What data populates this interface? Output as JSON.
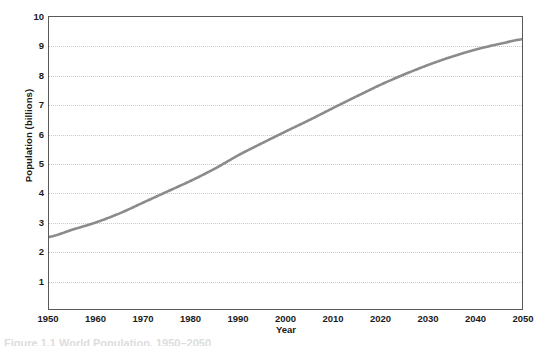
{
  "figure": {
    "caption_partial": "Figure 1.1  World Population, 1950–2050"
  },
  "chart_data": {
    "type": "line",
    "title": "",
    "xlabel": "Year",
    "ylabel": "Population (billions)",
    "xlim": [
      1950,
      2050
    ],
    "ylim": [
      0,
      10
    ],
    "grid": true,
    "grid_axis": "y",
    "legend": "none",
    "line_color": "#8b8b8b",
    "line_width_px": 2.6,
    "frame_color": "#595959",
    "gridline_color": "#c9c9c9",
    "background": "#ffffff",
    "xticks": [
      1950,
      1960,
      1970,
      1980,
      1990,
      2000,
      2010,
      2020,
      2030,
      2040,
      2050
    ],
    "xtick_labels": [
      "1950",
      "1960",
      "1970",
      "1980",
      "1990",
      "2000",
      "2010",
      "2020",
      "2030",
      "2040",
      "2050"
    ],
    "yticks": [
      1,
      2,
      3,
      4,
      5,
      6,
      7,
      8,
      9,
      10
    ],
    "ytick_labels": [
      "1",
      "2",
      "3",
      "4",
      "5",
      "6",
      "7",
      "8",
      "9",
      "10"
    ],
    "series": [
      {
        "name": "World population",
        "x": [
          1950,
          1955,
          1960,
          1965,
          1970,
          1975,
          1980,
          1985,
          1990,
          1995,
          2000,
          2005,
          2010,
          2015,
          2020,
          2025,
          2030,
          2035,
          2040,
          2045,
          2050
        ],
        "values": [
          2.52,
          2.77,
          3.02,
          3.33,
          3.7,
          4.07,
          4.44,
          4.85,
          5.31,
          5.72,
          6.12,
          6.51,
          6.92,
          7.32,
          7.71,
          8.06,
          8.38,
          8.66,
          8.9,
          9.09,
          9.25
        ]
      }
    ]
  }
}
